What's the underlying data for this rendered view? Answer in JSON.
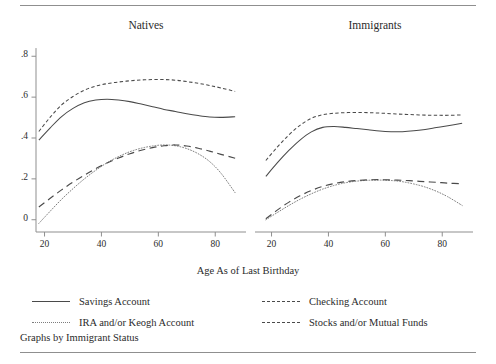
{
  "chart_data": {
    "type": "line",
    "title": "",
    "caption": "Graphs by Immigrant Status",
    "xlabel": "Age As of Last Birthday",
    "ylabel": "",
    "xlim": [
      17,
      88
    ],
    "ylim": [
      -0.06,
      0.86
    ],
    "xticks": [
      20,
      40,
      60,
      80
    ],
    "xtick_labels": [
      "20",
      "40",
      "60",
      "80"
    ],
    "yticks": [
      0,
      0.2,
      0.4,
      0.6,
      0.8
    ],
    "ytick_labels": [
      "0",
      ".2",
      ".4",
      ".6",
      ".8"
    ],
    "grid": false,
    "legend_position": "bottom",
    "panel_titles": [
      "Natives",
      "Immigrants"
    ],
    "series_styles": [
      "solid",
      "shortdash",
      "dotted",
      "longdash"
    ],
    "panels": [
      {
        "name": "Natives",
        "series": [
          {
            "name": "Savings Account",
            "style": "solid",
            "x": [
              18,
              22,
              26,
              30,
              34,
              38,
              42,
              46,
              50,
              54,
              58,
              62,
              66,
              70,
              74,
              78,
              82,
              87
            ],
            "y": [
              0.39,
              0.45,
              0.505,
              0.545,
              0.573,
              0.586,
              0.59,
              0.586,
              0.578,
              0.566,
              0.553,
              0.54,
              0.53,
              0.519,
              0.51,
              0.503,
              0.501,
              0.504
            ]
          },
          {
            "name": "Checking Account",
            "style": "shortdash",
            "x": [
              18,
              22,
              26,
              30,
              34,
              38,
              42,
              46,
              50,
              54,
              58,
              62,
              66,
              70,
              74,
              78,
              82,
              87
            ],
            "y": [
              0.432,
              0.502,
              0.562,
              0.603,
              0.634,
              0.654,
              0.666,
              0.674,
              0.68,
              0.684,
              0.686,
              0.686,
              0.683,
              0.676,
              0.668,
              0.657,
              0.645,
              0.628
            ]
          },
          {
            "name": "IRA and/or Keogh Account",
            "style": "dotted",
            "x": [
              18,
              22,
              26,
              30,
              34,
              38,
              42,
              46,
              50,
              54,
              58,
              62,
              66,
              70,
              74,
              78,
              82,
              87
            ],
            "y": [
              -0.018,
              0.042,
              0.1,
              0.152,
              0.2,
              0.242,
              0.279,
              0.309,
              0.333,
              0.35,
              0.361,
              0.366,
              0.362,
              0.348,
              0.323,
              0.285,
              0.228,
              0.132
            ]
          },
          {
            "name": "Stocks and/or Mutual Funds",
            "style": "longdash",
            "x": [
              18,
              22,
              26,
              30,
              34,
              38,
              42,
              46,
              50,
              54,
              58,
              62,
              66,
              70,
              74,
              78,
              82,
              87
            ],
            "y": [
              0.062,
              0.105,
              0.146,
              0.184,
              0.218,
              0.25,
              0.278,
              0.302,
              0.323,
              0.34,
              0.353,
              0.362,
              0.366,
              0.361,
              0.35,
              0.336,
              0.32,
              0.301
            ]
          }
        ]
      },
      {
        "name": "Immigrants",
        "series": [
          {
            "name": "Savings Account",
            "style": "solid",
            "x": [
              18,
              22,
              26,
              30,
              34,
              38,
              42,
              46,
              50,
              54,
              58,
              62,
              66,
              70,
              74,
              78,
              82,
              87
            ],
            "y": [
              0.212,
              0.278,
              0.338,
              0.39,
              0.43,
              0.452,
              0.456,
              0.452,
              0.446,
              0.44,
              0.434,
              0.431,
              0.431,
              0.435,
              0.442,
              0.451,
              0.46,
              0.472
            ]
          },
          {
            "name": "Checking Account",
            "style": "shortdash",
            "x": [
              18,
              22,
              26,
              30,
              34,
              38,
              42,
              46,
              50,
              54,
              58,
              62,
              66,
              70,
              74,
              78,
              82,
              87
            ],
            "y": [
              0.29,
              0.355,
              0.414,
              0.462,
              0.496,
              0.514,
              0.521,
              0.524,
              0.525,
              0.524,
              0.522,
              0.519,
              0.516,
              0.514,
              0.512,
              0.511,
              0.511,
              0.513
            ]
          },
          {
            "name": "IRA and/or Keogh Account",
            "style": "dotted",
            "x": [
              18,
              22,
              26,
              30,
              34,
              38,
              42,
              46,
              50,
              54,
              58,
              62,
              66,
              70,
              74,
              78,
              82,
              87
            ],
            "y": [
              0.0,
              0.035,
              0.069,
              0.1,
              0.127,
              0.15,
              0.168,
              0.181,
              0.189,
              0.193,
              0.194,
              0.192,
              0.186,
              0.175,
              0.16,
              0.139,
              0.112,
              0.07
            ]
          },
          {
            "name": "Stocks and/or Mutual Funds",
            "style": "longdash",
            "x": [
              18,
              22,
              26,
              30,
              34,
              38,
              42,
              46,
              50,
              54,
              58,
              62,
              66,
              70,
              74,
              78,
              82,
              87
            ],
            "y": [
              0.005,
              0.047,
              0.085,
              0.117,
              0.143,
              0.163,
              0.177,
              0.186,
              0.192,
              0.195,
              0.196,
              0.195,
              0.193,
              0.19,
              0.186,
              0.183,
              0.179,
              0.176
            ]
          }
        ]
      }
    ]
  },
  "panels": {
    "left_title": "Natives",
    "right_title": "Immigrants"
  },
  "axes": {
    "x_title": "Age As of Last Birthday",
    "y_tick_labels": [
      "0",
      ".2",
      ".4",
      ".6",
      ".8"
    ],
    "x_tick_labels": [
      "20",
      "40",
      "60",
      "80"
    ]
  },
  "legend": {
    "savings": "Savings Account",
    "checking": "Checking Account",
    "ira": "IRA and/or Keogh Account",
    "stocks": "Stocks and/or Mutual Funds"
  },
  "caption": "Graphs by Immigrant Status",
  "colors": {
    "line": "#4a4a4a",
    "dotted_line": "#7d7d7d",
    "axis": "#8f8f8f",
    "text": "#2b2b2b",
    "rule": "#8f8f8f",
    "background": "#ffffff"
  }
}
